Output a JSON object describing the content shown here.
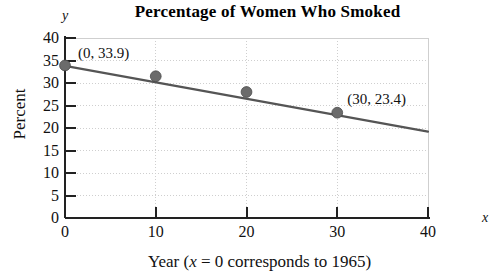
{
  "chart_data": {
    "type": "scatter",
    "title": "Percentage of Women Who Smoked",
    "xlabel": "Year (x = 0 corresponds to 1965)",
    "ylabel": "Percent",
    "x_axis_variable": "x",
    "y_axis_variable": "y",
    "xlim": [
      0,
      40
    ],
    "ylim": [
      0,
      40
    ],
    "xticks": [
      0,
      10,
      20,
      30,
      40
    ],
    "xtick_labels": [
      "0",
      "10",
      "20",
      "30",
      "40"
    ],
    "yticks": [
      0,
      5,
      10,
      15,
      20,
      25,
      30,
      35,
      40
    ],
    "ytick_labels": [
      "0",
      "5",
      "10",
      "15",
      "20",
      "25",
      "30",
      "35",
      "40"
    ],
    "grid": true,
    "legend": false,
    "x": [
      0,
      10,
      20,
      30
    ],
    "values": [
      33.9,
      31.5,
      28.0,
      23.4
    ],
    "series": [
      {
        "name": "Percentage of women who smoked",
        "x": [
          0,
          10,
          20,
          30
        ],
        "values": [
          33.9,
          31.5,
          28.0,
          23.4
        ]
      }
    ],
    "trend_line": {
      "name": "linear regression line",
      "x_start": 0,
      "y_start": 33.8,
      "x_end": 40,
      "y_end": 19.2
    },
    "annotations": [
      {
        "label": "(0, 33.9)",
        "x": 0,
        "y": 33.9
      },
      {
        "label": "(30, 23.4)",
        "x": 30,
        "y": 23.4
      }
    ],
    "colors": {
      "point_fill": "#6b6b6b",
      "line": "#555555",
      "axis": "#222222",
      "grid": "#cfcfcf",
      "text": "#111111"
    }
  },
  "xlabel_parts": {
    "prefix": "Year (",
    "variable": "x",
    "suffix": " = 0 corresponds to 1965)"
  }
}
